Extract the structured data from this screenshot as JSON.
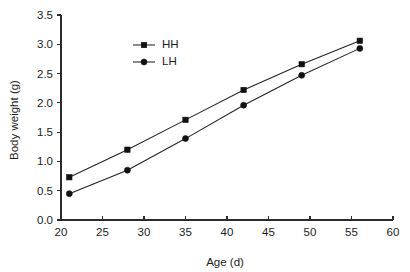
{
  "chart_data": {
    "type": "line",
    "title": "",
    "xlabel": "Age (d)",
    "ylabel": "Body weight (g)",
    "x": [
      21,
      28,
      35,
      42,
      49,
      56
    ],
    "xlim": [
      20,
      60
    ],
    "ylim": [
      0.0,
      3.5
    ],
    "xticks": [
      20,
      25,
      30,
      35,
      40,
      45,
      50,
      55,
      60
    ],
    "xtick_labels": [
      "20",
      "25",
      "30",
      "35",
      "40",
      "45",
      "50",
      "55",
      "60"
    ],
    "yticks": [
      0.0,
      0.5,
      1.0,
      1.5,
      2.0,
      2.5,
      3.0,
      3.5
    ],
    "ytick_labels": [
      "0.0",
      "0.5",
      "1.0",
      "1.5",
      "2.0",
      "2.5",
      "3.0",
      "3.5"
    ],
    "grid": false,
    "legend_position": "upper-left-inside",
    "series": [
      {
        "name": "HH",
        "marker": "square",
        "color": "#111111",
        "values": [
          0.73,
          1.2,
          1.71,
          2.22,
          2.66,
          3.06
        ]
      },
      {
        "name": "LH",
        "marker": "circle",
        "color": "#111111",
        "values": [
          0.45,
          0.85,
          1.39,
          1.96,
          2.47,
          2.93
        ]
      }
    ]
  },
  "legend": {
    "items": [
      {
        "label": "HH",
        "marker": "square"
      },
      {
        "label": "LH",
        "marker": "circle"
      }
    ]
  },
  "axes": {
    "x_title": "Age (d)",
    "y_title": "Body weight (g)"
  }
}
